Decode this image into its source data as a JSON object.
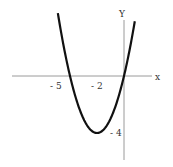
{
  "chart_data": {
    "type": "line",
    "title": "",
    "function": "y = x^2 + 4x",
    "xlabel": "x",
    "ylabel": "Y",
    "x_ticks": [
      "-5",
      "-2"
    ],
    "y_ticks": [
      "-4"
    ],
    "vertex": [
      -2,
      -4
    ],
    "roots": [
      -4,
      0
    ],
    "series": [
      {
        "name": "parabola",
        "x": [
          -4.9,
          -4,
          -3,
          -2,
          -1,
          0,
          0.8
        ],
        "y": [
          3.6,
          0,
          -3,
          -4,
          -3,
          0,
          3.84
        ]
      }
    ],
    "xlim": [
      -8.3,
      2.1
    ],
    "ylim": [
      -5.9,
      5.3
    ],
    "grid": false
  },
  "labels": {
    "x_axis": "x",
    "y_axis": "Y",
    "tick_neg5": "- 5",
    "tick_neg2": "- 2",
    "tick_neg4": "- 4"
  },
  "colors": {
    "axis": "#999999",
    "curve": "#111111"
  }
}
